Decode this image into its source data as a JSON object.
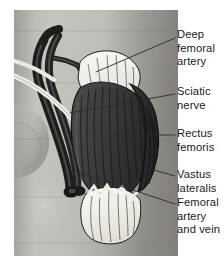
{
  "figure": {
    "type": "anatomical-illustration",
    "background_color": "#ffffff",
    "plate": {
      "left": 14,
      "top": 10,
      "width": 164,
      "height": 246,
      "skin_tone_light": "#c9c7c2",
      "skin_tone_mid": "#a9a7a2",
      "skin_tone_shadow": "#8d8b87"
    },
    "palette": {
      "muscle_dark": "#3a3a3a",
      "muscle_mid": "#4e4e4e",
      "muscle_fiber_line": "#1d1d1d",
      "vessel_dark": "#242424",
      "vessel_highlight": "#6a6a6a",
      "tendon_white": "#f2f0ea",
      "outline": "#111111",
      "leader_line": "#2a2a2a",
      "label_text": "#1a1a1a"
    }
  },
  "labels": [
    {
      "id": "deep-femoral-artery",
      "text": "Deep\nfemoral\nartery",
      "lines": [
        "Deep",
        "femoral",
        "artery"
      ],
      "x": 177,
      "y": 28,
      "leader": {
        "x1": 175,
        "y1": 38,
        "x2": 96,
        "y2": 72
      }
    },
    {
      "id": "sciatic-nerve",
      "text": "Sciatic\nnerve",
      "lines": [
        "Sciatic",
        "nerve"
      ],
      "x": 177,
      "y": 85,
      "leader": {
        "x1": 175,
        "y1": 94,
        "x2": 70,
        "y2": 113
      }
    },
    {
      "id": "rectus-femoris",
      "text": "Rectus\nfemoris",
      "lines": [
        "Rectus",
        "femoris"
      ],
      "x": 177,
      "y": 127,
      "leader": {
        "x1": 175,
        "y1": 135,
        "x2": 113,
        "y2": 135
      }
    },
    {
      "id": "vastus-lateralis",
      "text": "Vastus\nlateralis",
      "lines": [
        "Vastus",
        "lateralis"
      ],
      "x": 177,
      "y": 168,
      "leader": {
        "x1": 175,
        "y1": 176,
        "x2": 140,
        "y2": 166
      }
    },
    {
      "id": "femoral-artery-and-vein",
      "text": "Femoral\nartery\nand vein",
      "lines": [
        "Femoral",
        "artery",
        "and vein"
      ],
      "x": 177,
      "y": 196,
      "leader": {
        "x1": 175,
        "y1": 204,
        "x2": 72,
        "y2": 170
      }
    }
  ],
  "structures": [
    {
      "id": "deep-femoral-artery",
      "name": "Deep femoral artery",
      "kind": "artery",
      "color": "#242424"
    },
    {
      "id": "sciatic-nerve",
      "name": "Sciatic nerve",
      "kind": "nerve",
      "color": "#f2f0ea"
    },
    {
      "id": "rectus-femoris",
      "name": "Rectus femoris",
      "kind": "muscle",
      "color": "#3f3f3f"
    },
    {
      "id": "vastus-lateralis",
      "name": "Vastus lateralis",
      "kind": "muscle",
      "color": "#2e2e2e"
    },
    {
      "id": "femoral-artery-and-vein",
      "name": "Femoral artery and vein",
      "kind": "vessel-bundle",
      "color": "#242424"
    },
    {
      "id": "proximal-tendon",
      "name": "Proximal tendon of rectus femoris",
      "kind": "tendon",
      "color": "#f2f0ea"
    },
    {
      "id": "distal-tendon",
      "name": "Distal quadriceps tendon",
      "kind": "tendon",
      "color": "#f2f0ea"
    }
  ]
}
